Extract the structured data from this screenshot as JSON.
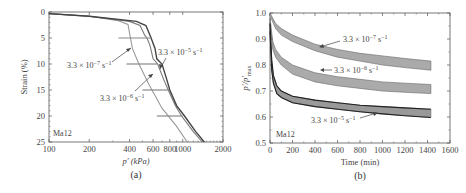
{
  "chart_data": [
    {
      "id": "a",
      "type": "line",
      "panel_label": "(a)",
      "xlabel": "p′ (kPa)",
      "ylabel": "Strain (%)",
      "xscale": "log",
      "xlim": [
        100,
        2000
      ],
      "ylim": [
        25,
        0
      ],
      "y_inverted": true,
      "xticks": [
        100,
        200,
        400,
        600,
        800,
        1000,
        2000
      ],
      "xtick_labels": [
        "100",
        "200",
        "400",
        "600",
        "800",
        "1000",
        "2000"
      ],
      "yticks": [
        0,
        5,
        10,
        15,
        20,
        25
      ],
      "ytick_labels": [
        "0",
        "5",
        "10",
        "15",
        "20",
        "25"
      ],
      "annotation_box": "Ma12",
      "series": [
        {
          "name": "3.3 × 10⁻⁷ s⁻¹",
          "color": "#999999",
          "points": [
            [
              100,
              0.3
            ],
            [
              200,
              0.8
            ],
            [
              330,
              1.7
            ],
            [
              390,
              2.4
            ],
            [
              400,
              4
            ],
            [
              420,
              7
            ],
            [
              470,
              10
            ],
            [
              560,
              14
            ],
            [
              700,
              18.5
            ],
            [
              900,
              22
            ],
            [
              1080,
              25
            ]
          ]
        },
        {
          "name": "3.3 × 10⁻⁶ s⁻¹",
          "color": "#777777",
          "points": [
            [
              100,
              0.3
            ],
            [
              200,
              0.8
            ],
            [
              400,
              1.8
            ],
            [
              480,
              2.6
            ],
            [
              520,
              4.5
            ],
            [
              540,
              5
            ],
            [
              570,
              6.5
            ],
            [
              600,
              9
            ],
            [
              650,
              10
            ],
            [
              720,
              13
            ],
            [
              780,
              15
            ],
            [
              880,
              18
            ],
            [
              980,
              20
            ],
            [
              1200,
              23
            ],
            [
              1400,
              25
            ]
          ]
        },
        {
          "name": "3.3 × 10⁻⁵ s⁻¹",
          "color": "#444444",
          "points": [
            [
              100,
              0.3
            ],
            [
              200,
              0.8
            ],
            [
              450,
              1.8
            ],
            [
              530,
              2.6
            ],
            [
              570,
              4.5
            ],
            [
              580,
              5
            ],
            [
              620,
              7
            ],
            [
              640,
              9
            ],
            [
              700,
              10
            ],
            [
              760,
              13
            ],
            [
              800,
              15
            ],
            [
              900,
              18
            ],
            [
              1030,
              20
            ],
            [
              1250,
              23
            ],
            [
              1450,
              25
            ]
          ]
        }
      ],
      "relaxation_segments": [
        {
          "strain": 5,
          "p_from": 580,
          "p_to": 330
        },
        {
          "strain": 10,
          "p_from": 650,
          "p_to": 380
        },
        {
          "strain": 15,
          "p_from": 780,
          "p_to": 500
        },
        {
          "strain": 20,
          "p_from": 1000,
          "p_to": 640
        }
      ],
      "annotations": [
        {
          "text": "3.3 × 10⁻⁷ s⁻¹",
          "at": [
            200,
            11
          ]
        },
        {
          "text": "3.3 × 10⁻⁵ s⁻¹",
          "at": [
            700,
            8
          ]
        },
        {
          "text": "3.3 × 10⁻⁶ s⁻¹",
          "at": [
            300,
            16.5
          ]
        }
      ]
    },
    {
      "id": "b",
      "type": "area",
      "panel_label": "(b)",
      "xlabel": "Time (min)",
      "ylabel": "p′/p′max",
      "xlim": [
        0,
        1600
      ],
      "ylim": [
        0.5,
        1.0
      ],
      "xticks": [
        0,
        200,
        400,
        600,
        800,
        1000,
        1200,
        1400,
        1600
      ],
      "xtick_labels": [
        "0",
        "200",
        "400",
        "600",
        "800",
        "1000",
        "1200",
        "1400",
        "1600"
      ],
      "yticks": [
        0.5,
        0.6,
        0.7,
        0.8,
        0.9,
        1.0
      ],
      "ytick_labels": [
        "0.5",
        "0.6",
        "0.7",
        "0.8",
        "0.9",
        "1.0"
      ],
      "annotation_box": "Ma12",
      "series": [
        {
          "name": "3.3 × 10⁻⁷ s⁻¹",
          "fill": "#aaaaaa",
          "upper": {
            "x": [
              0,
              50,
              100,
              200,
              400,
              600,
              800,
              1000,
              1200,
              1430
            ],
            "y": [
              1.0,
              0.96,
              0.94,
              0.915,
              0.88,
              0.86,
              0.845,
              0.835,
              0.825,
              0.815
            ]
          },
          "lower": {
            "x": [
              0,
              50,
              100,
              200,
              400,
              600,
              800,
              1000,
              1200,
              1430
            ],
            "y": [
              0.99,
              0.94,
              0.915,
              0.89,
              0.855,
              0.83,
              0.815,
              0.8,
              0.79,
              0.78
            ]
          }
        },
        {
          "name": "3.3 × 10⁻⁶ s⁻¹",
          "fill": "#aaaaaa",
          "upper": {
            "x": [
              0,
              25,
              50,
              100,
              200,
              400,
              600,
              800,
              1000,
              1200,
              1430
            ],
            "y": [
              0.98,
              0.89,
              0.86,
              0.83,
              0.8,
              0.77,
              0.755,
              0.745,
              0.735,
              0.73,
              0.725
            ]
          },
          "lower": {
            "x": [
              0,
              25,
              50,
              100,
              200,
              400,
              600,
              800,
              1000,
              1200,
              1430
            ],
            "y": [
              0.96,
              0.86,
              0.83,
              0.8,
              0.765,
              0.735,
              0.72,
              0.71,
              0.7,
              0.695,
              0.69
            ]
          }
        },
        {
          "name": "3.3 × 10⁻⁵ s⁻¹",
          "fill": "#999999",
          "upper": {
            "x": [
              0,
              15,
              30,
              60,
              100,
              200,
              400,
              600,
              800,
              1000,
              1200,
              1430
            ],
            "y": [
              0.96,
              0.82,
              0.76,
              0.72,
              0.7,
              0.68,
              0.665,
              0.655,
              0.645,
              0.64,
              0.635,
              0.63
            ]
          },
          "lower": {
            "x": [
              0,
              15,
              30,
              60,
              100,
              200,
              400,
              600,
              800,
              1000,
              1200,
              1430
            ],
            "y": [
              0.93,
              0.78,
              0.73,
              0.69,
              0.675,
              0.655,
              0.64,
              0.63,
              0.62,
              0.612,
              0.605,
              0.598
            ]
          }
        }
      ],
      "annotations": [
        {
          "text": "3.3 × 10⁻⁷ s⁻¹",
          "at": [
            880,
            0.905
          ]
        },
        {
          "text": "3.3 × 10⁻⁶ s⁻¹",
          "at": [
            660,
            0.772
          ]
        },
        {
          "text": "3.3 × 10⁻⁵ s⁻¹",
          "at": [
            640,
            0.575
          ]
        }
      ]
    }
  ]
}
